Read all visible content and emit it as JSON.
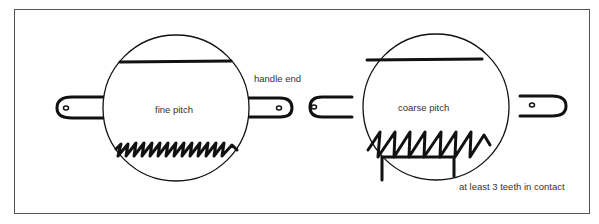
{
  "diagram": {
    "labels": {
      "fine": "fine pitch",
      "coarse": "coarse pitch",
      "handle_end": "handle end",
      "contact": "at least 3 teeth in contact"
    },
    "colors": {
      "stroke": "#111111",
      "frame": "#555555",
      "text": "#333333"
    },
    "blades": [
      {
        "name": "fine-pitch-blade",
        "cx": 176,
        "cy": 108,
        "r": 73,
        "teeth": 12
      },
      {
        "name": "coarse-pitch-blade",
        "cx": 436,
        "cy": 107,
        "r": 73,
        "teeth": 7
      }
    ]
  }
}
